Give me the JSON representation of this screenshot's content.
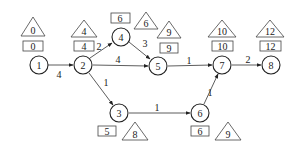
{
  "diagram": {
    "type": "activity-network",
    "nodes": [
      {
        "id": "1",
        "label": "1",
        "early": "0",
        "late": "0"
      },
      {
        "id": "2",
        "label": "2",
        "early": "4",
        "late": "4"
      },
      {
        "id": "3",
        "label": "3",
        "early": "5",
        "late": "8"
      },
      {
        "id": "4",
        "label": "4",
        "early": "6",
        "late": "6"
      },
      {
        "id": "5",
        "label": "5",
        "early": "9",
        "late": "9"
      },
      {
        "id": "6",
        "label": "6",
        "early": "6",
        "late": "9"
      },
      {
        "id": "7",
        "label": "7",
        "early": "10",
        "late": "10"
      },
      {
        "id": "8",
        "label": "8",
        "early": "12",
        "late": "12"
      }
    ],
    "edges": [
      {
        "from": "1",
        "to": "2",
        "duration": "4"
      },
      {
        "from": "2",
        "to": "4",
        "duration": "2"
      },
      {
        "from": "2",
        "to": "5",
        "duration": "4"
      },
      {
        "from": "2",
        "to": "3",
        "duration": "1"
      },
      {
        "from": "4",
        "to": "5",
        "duration": "3"
      },
      {
        "from": "5",
        "to": "7",
        "duration": "1"
      },
      {
        "from": "3",
        "to": "6",
        "duration": "1"
      },
      {
        "from": "6",
        "to": "7",
        "duration": "1"
      },
      {
        "from": "7",
        "to": "8",
        "duration": "2"
      }
    ],
    "legend": {
      "box_meaning": "earliest time",
      "triangle_meaning": "latest time"
    }
  }
}
